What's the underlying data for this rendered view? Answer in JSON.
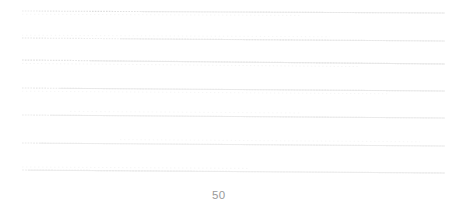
{
  "figure": {
    "background_color": "#ffffff",
    "width": 461,
    "height": 212
  },
  "axis": {
    "x_tick_labels": [
      "50"
    ],
    "x_tick_label_value": "50",
    "label_color": "#9a9a9a",
    "grid": true,
    "grid_style": "dotted",
    "grid_color": "#e8e8e8"
  },
  "chart_data": {
    "type": "line",
    "title": "",
    "subtitle": "",
    "xlabel": "",
    "ylabel": "",
    "grid": true,
    "legend": "none",
    "xlim": [
      22,
      445
    ],
    "ylim": [
      0,
      182
    ],
    "x": [
      22,
      445
    ],
    "note": "Seven near-horizontal faint dotted gridlines spanning the plot width, each with a slight downward slope from left to right; single x tick label '50' below the plot.",
    "series": [
      {
        "name": "line-1",
        "y_left": 11,
        "y_right": 13,
        "values": [
          11,
          13
        ],
        "color": "#e6e6e6"
      },
      {
        "name": "line-2",
        "y_left": 38,
        "y_right": 41,
        "values": [
          38,
          41
        ],
        "color": "#e6e6e6"
      },
      {
        "name": "line-3",
        "y_left": 60,
        "y_right": 64,
        "values": [
          60,
          64
        ],
        "color": "#e4e4e4"
      },
      {
        "name": "line-4",
        "y_left": 88,
        "y_right": 91,
        "values": [
          88,
          91
        ],
        "color": "#e6e6e6"
      },
      {
        "name": "line-5",
        "y_left": 115,
        "y_right": 118,
        "values": [
          115,
          118
        ],
        "color": "#ececec"
      },
      {
        "name": "line-6",
        "y_left": 143,
        "y_right": 146,
        "values": [
          143,
          146
        ],
        "color": "#ececec"
      },
      {
        "name": "line-7",
        "y_left": 170,
        "y_right": 173,
        "values": [
          170,
          173
        ],
        "color": "#efefef"
      }
    ]
  }
}
